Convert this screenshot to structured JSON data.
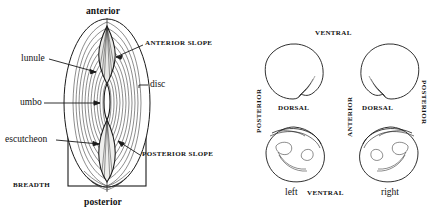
{
  "figure": {
    "stroke_color": "#1a1a1a",
    "fill_color": "#ffffff",
    "lunule_fill": "#e8e8e6"
  },
  "left_diagram": {
    "name": "dorsal-view-with-terminology",
    "labels": {
      "anterior": "anterior",
      "posterior": "posterior",
      "lunule": "lunule",
      "umbo": "umbo",
      "escutcheon": "escutcheon",
      "disc": "disc",
      "anterior_slope": "ANTERIOR SLOPE",
      "posterior_slope": "POSTERIOR SLOPE",
      "breadth": "BREADTH"
    }
  },
  "right_diagram": {
    "name": "four-valve-orientation-views",
    "labels": {
      "ventral_top": "VENTRAL",
      "ventral_bottom": "VENTRAL",
      "dorsal_left": "DORSAL",
      "dorsal_right": "DORSAL",
      "anterior_center": "ANTERIOR",
      "posterior_left": "POSTERIOR",
      "posterior_right": "POSTERIOR",
      "left_valve": "left",
      "right_valve": "right"
    },
    "views": [
      {
        "name": "exterior-left-valve",
        "position": "top-left"
      },
      {
        "name": "exterior-right-valve",
        "position": "top-right"
      },
      {
        "name": "interior-left-valve",
        "position": "bottom-left"
      },
      {
        "name": "interior-right-valve",
        "position": "bottom-right"
      }
    ]
  }
}
